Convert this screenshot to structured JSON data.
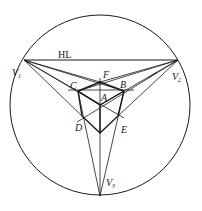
{
  "diagram": {
    "stroke_color": "#1a1a1a",
    "background": "#ffffff",
    "circle": {
      "cx": 100,
      "cy": 105,
      "r": 90
    },
    "horizon_label": "HL",
    "points": {
      "V1": {
        "label": "V",
        "sub": "1",
        "x": 24,
        "y": 60
      },
      "V2": {
        "label": "V",
        "sub": "2",
        "x": 178,
        "y": 60
      },
      "V3": {
        "label": "V",
        "sub": "3",
        "x": 100,
        "y": 196
      },
      "A": {
        "label": "A",
        "x": 100,
        "y": 105
      },
      "B": {
        "label": "B",
        "x": 124,
        "y": 91
      },
      "C": {
        "label": "C",
        "x": 78,
        "y": 91
      },
      "D": {
        "label": "D",
        "x": 82,
        "y": 116
      },
      "E": {
        "label": "E",
        "x": 118,
        "y": 116
      },
      "F": {
        "label": "F",
        "x": 100,
        "y": 82
      }
    }
  }
}
